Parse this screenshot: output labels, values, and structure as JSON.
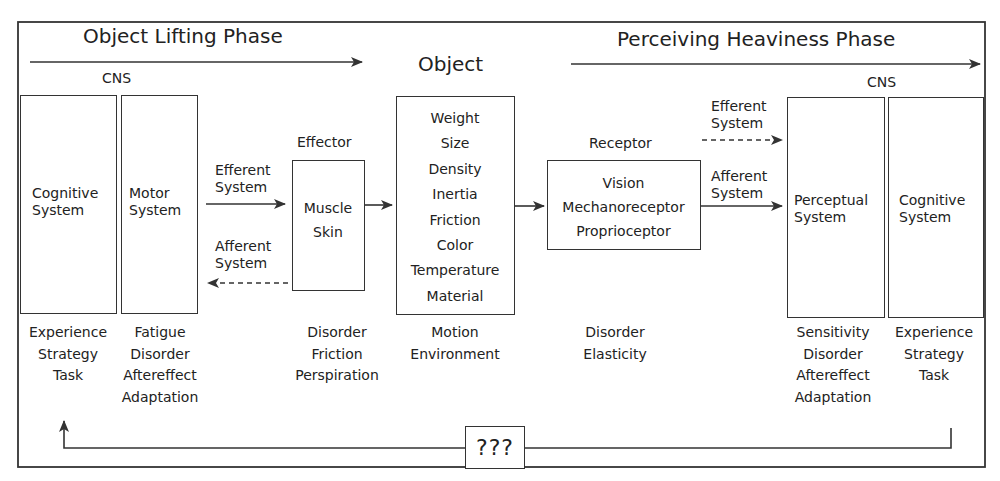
{
  "phases": {
    "left": "Object Lifting Phase",
    "right": "Perceiving Heaviness Phase"
  },
  "object_title": "Object",
  "left_cns": {
    "header": "CNS",
    "cognitive": {
      "line1": "Cognitive",
      "line2": "System"
    },
    "motor": {
      "line1": "Motor",
      "line2": "System"
    }
  },
  "effector": {
    "header": "Effector",
    "items": [
      "Muscle",
      "Skin"
    ]
  },
  "object": {
    "items": [
      "Weight",
      "Size",
      "Density",
      "Inertia",
      "Friction",
      "Color",
      "Temperature",
      "Material"
    ]
  },
  "receptor": {
    "header": "Receptor",
    "items": [
      "Vision",
      "Mechanoreceptor",
      "Proprioceptor"
    ]
  },
  "right_cns": {
    "header": "CNS",
    "perceptual": {
      "line1": "Perceptual",
      "line2": "System"
    },
    "cognitive": {
      "line1": "Cognitive",
      "line2": "System"
    }
  },
  "connectors": {
    "left_efferent": {
      "line1": "Efferent",
      "line2": "System"
    },
    "left_afferent": {
      "line1": "Afferent",
      "line2": "System"
    },
    "right_efferent": {
      "line1": "Efferent",
      "line2": "System"
    },
    "right_afferent": {
      "line1": "Afferent",
      "line2": "System"
    }
  },
  "factors": {
    "left_cognitive": [
      "Experience",
      "Strategy",
      "Task"
    ],
    "motor": [
      "Fatigue",
      "Disorder",
      "Aftereffect",
      "Adaptation"
    ],
    "effector": [
      "Disorder",
      "Friction",
      "Perspiration"
    ],
    "object": [
      "Motion",
      "Environment"
    ],
    "receptor": [
      "Disorder",
      "Elasticity"
    ],
    "perceptual": [
      "Sensitivity",
      "Disorder",
      "Aftereffect",
      "Adaptation"
    ],
    "right_cognitive": [
      "Experience",
      "Strategy",
      "Task"
    ]
  },
  "feedback": {
    "label": "???"
  },
  "colors": {
    "line": "#333333",
    "background": "#ffffff",
    "text": "#222222"
  }
}
